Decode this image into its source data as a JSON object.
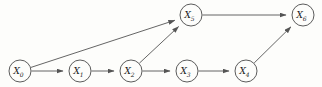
{
  "diagram": {
    "type": "directed-graph",
    "background_color": "#fdfdfb",
    "node_stroke_color": "#4a4a4a",
    "edge_color": "#545454",
    "label_color": "#1a1a1a",
    "node_radius": 11,
    "nodes": [
      {
        "id": "X0",
        "base": "X",
        "sub": "0",
        "label": "X0",
        "cx": 20,
        "cy": 71
      },
      {
        "id": "X1",
        "base": "X",
        "sub": "1",
        "label": "X1",
        "cx": 80,
        "cy": 71
      },
      {
        "id": "X2",
        "base": "X",
        "sub": "2",
        "label": "X2",
        "cx": 131,
        "cy": 71
      },
      {
        "id": "X3",
        "base": "X",
        "sub": "3",
        "label": "X3",
        "cx": 187,
        "cy": 71
      },
      {
        "id": "X4",
        "base": "X",
        "sub": "4",
        "label": "X4",
        "cx": 246,
        "cy": 71
      },
      {
        "id": "X5",
        "base": "X",
        "sub": "5",
        "label": "X5",
        "cx": 191,
        "cy": 15
      },
      {
        "id": "X6",
        "base": "X",
        "sub": "6",
        "label": "X6",
        "cx": 303,
        "cy": 15
      }
    ],
    "edges": [
      {
        "id": "e0",
        "from": "X0",
        "to": "X1",
        "label": "X0 to X1"
      },
      {
        "id": "e1",
        "from": "X1",
        "to": "X2",
        "label": "X1 to X2"
      },
      {
        "id": "e2",
        "from": "X2",
        "to": "X3",
        "label": "X2 to X3"
      },
      {
        "id": "e3",
        "from": "X3",
        "to": "X4",
        "label": "X3 to X4"
      },
      {
        "id": "e4",
        "from": "X0",
        "to": "X5",
        "label": "X0 to X5"
      },
      {
        "id": "e5",
        "from": "X2",
        "to": "X5",
        "label": "X2 to X5"
      },
      {
        "id": "e6",
        "from": "X5",
        "to": "X6",
        "label": "X5 to X6"
      },
      {
        "id": "e7",
        "from": "X4",
        "to": "X6",
        "label": "X4 to X6"
      }
    ]
  }
}
